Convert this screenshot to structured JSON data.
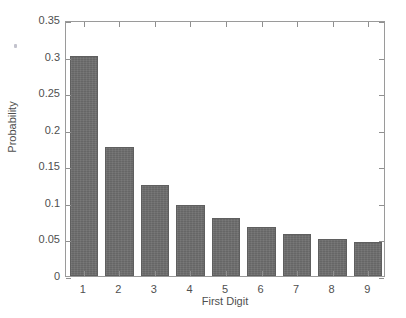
{
  "chart_data": {
    "type": "bar",
    "title": "",
    "subtitle": "",
    "xlabel": "First Digit",
    "ylabel": "Probability",
    "categories": [
      "1",
      "2",
      "3",
      "4",
      "5",
      "6",
      "7",
      "8",
      "9"
    ],
    "values": [
      0.301,
      0.176,
      0.125,
      0.097,
      0.079,
      0.067,
      0.058,
      0.051,
      0.046
    ],
    "series": [
      {
        "name": "Probability",
        "values": [
          0.301,
          0.176,
          0.125,
          0.097,
          0.079,
          0.067,
          0.058,
          0.051,
          0.046
        ]
      }
    ],
    "ylim": [
      0,
      0.35
    ],
    "xlim": [
      0.5,
      9.5
    ],
    "ytick_values": [
      0,
      0.05,
      0.1,
      0.15,
      0.2,
      0.25,
      0.3,
      0.35
    ],
    "ytick_labels": [
      "0",
      "0.05",
      "0.1",
      "0.15",
      "0.2",
      "0.25",
      "0.3",
      "0.35"
    ],
    "xtick_labels": [
      "1",
      "2",
      "3",
      "4",
      "5",
      "6",
      "7",
      "8",
      "9"
    ],
    "grid": false,
    "legend": null,
    "legend_position": "none",
    "bar_color": "#6d6d6d",
    "bar_edge_color": "#5f5f5f",
    "axis_color": "#9a9a9a",
    "text_color": "#4f4f4f",
    "background_color": "#ffffff",
    "bar_width_fraction": 0.8,
    "annotations": []
  },
  "figure": {
    "axis_box": {
      "left": 65,
      "top": 21,
      "width": 320,
      "height": 256
    }
  }
}
